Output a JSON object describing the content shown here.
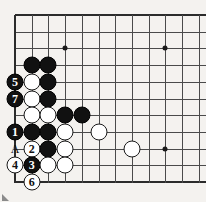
{
  "diagram": {
    "kind": "go-board-problem-diagram",
    "board": {
      "edges": {
        "left": true,
        "top": true,
        "bottom": true,
        "right": false
      },
      "origin_x": 15,
      "origin_y": 15,
      "spacing": 16.7,
      "cols": 12,
      "rows": 11,
      "line_color": "#4a4a4a",
      "edge_color": "#2b2b2b",
      "background": "#f4f2ef"
    },
    "star_points": [
      {
        "col": 3,
        "row": 2
      },
      {
        "col": 9,
        "row": 2
      },
      {
        "col": 9,
        "row": 8
      }
    ],
    "stones": [
      {
        "col": 1,
        "row": 3,
        "color": "black",
        "label": ""
      },
      {
        "col": 2,
        "row": 3,
        "color": "black",
        "label": ""
      },
      {
        "col": 0,
        "row": 4,
        "color": "black",
        "label": "5"
      },
      {
        "col": 1,
        "row": 4,
        "color": "white",
        "label": ""
      },
      {
        "col": 2,
        "row": 4,
        "color": "black",
        "label": ""
      },
      {
        "col": 0,
        "row": 5,
        "color": "black",
        "label": "7"
      },
      {
        "col": 1,
        "row": 5,
        "color": "white",
        "label": ""
      },
      {
        "col": 2,
        "row": 5,
        "color": "black",
        "label": ""
      },
      {
        "col": 1,
        "row": 6,
        "color": "white",
        "label": ""
      },
      {
        "col": 2,
        "row": 6,
        "color": "white",
        "label": ""
      },
      {
        "col": 3,
        "row": 6,
        "color": "black",
        "label": ""
      },
      {
        "col": 4,
        "row": 6,
        "color": "black",
        "label": ""
      },
      {
        "col": 0,
        "row": 7,
        "color": "black",
        "label": "1"
      },
      {
        "col": 1,
        "row": 7,
        "color": "black",
        "label": ""
      },
      {
        "col": 2,
        "row": 7,
        "color": "black",
        "label": ""
      },
      {
        "col": 3,
        "row": 7,
        "color": "white",
        "label": ""
      },
      {
        "col": 5,
        "row": 7,
        "color": "white",
        "label": ""
      },
      {
        "col": 1,
        "row": 8,
        "color": "white",
        "label": "2"
      },
      {
        "col": 2,
        "row": 8,
        "color": "black",
        "label": ""
      },
      {
        "col": 3,
        "row": 8,
        "color": "white",
        "label": ""
      },
      {
        "col": 7,
        "row": 8,
        "color": "white",
        "label": ""
      },
      {
        "col": 0,
        "row": 9,
        "color": "white",
        "label": "4"
      },
      {
        "col": 1,
        "row": 9,
        "color": "black",
        "label": "3"
      },
      {
        "col": 2,
        "row": 9,
        "color": "white",
        "label": ""
      },
      {
        "col": 3,
        "row": 9,
        "color": "white",
        "label": ""
      },
      {
        "col": 1,
        "row": 10,
        "color": "white",
        "label": "6"
      }
    ],
    "point_labels": [
      {
        "col": 0,
        "row": 8,
        "text": "A"
      }
    ],
    "corner_mark": {
      "present": true,
      "color": "#8b8b8b"
    }
  }
}
